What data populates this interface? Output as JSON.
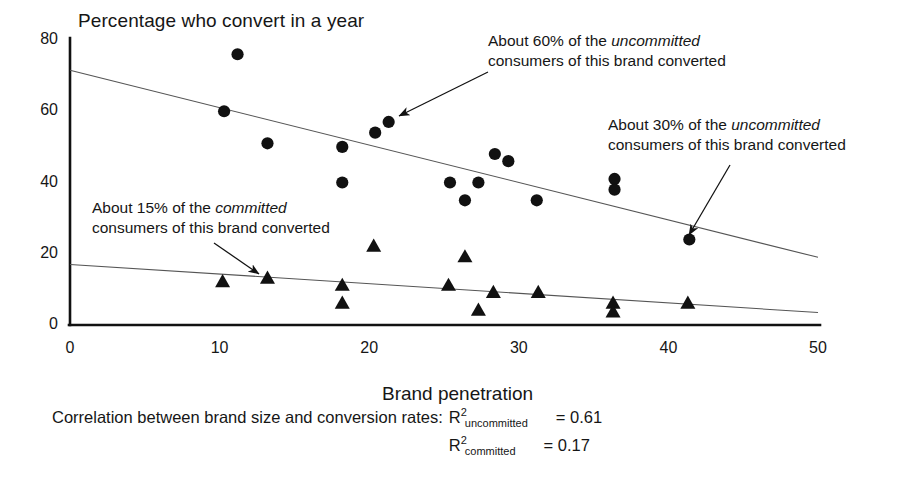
{
  "chart_data": {
    "type": "scatter",
    "title": "Percentage who convert in a year",
    "xlabel": "Brand penetration",
    "ylabel": "Percentage who convert in a year",
    "xlim": [
      0,
      50
    ],
    "ylim": [
      0,
      80
    ],
    "xticks": [
      0,
      10,
      20,
      30,
      40,
      50
    ],
    "yticks": [
      0,
      20,
      40,
      60,
      80
    ],
    "grid": false,
    "legend_position": "none",
    "series": [
      {
        "name": "uncommitted",
        "marker": "circle",
        "color": "#111111",
        "points": [
          {
            "x": 11.2,
            "y": 76
          },
          {
            "x": 10.3,
            "y": 60
          },
          {
            "x": 13.2,
            "y": 51
          },
          {
            "x": 18.2,
            "y": 50
          },
          {
            "x": 18.2,
            "y": 40
          },
          {
            "x": 20.4,
            "y": 54
          },
          {
            "x": 21.3,
            "y": 57
          },
          {
            "x": 25.4,
            "y": 40
          },
          {
            "x": 26.4,
            "y": 35
          },
          {
            "x": 27.3,
            "y": 40
          },
          {
            "x": 28.4,
            "y": 48
          },
          {
            "x": 29.3,
            "y": 46
          },
          {
            "x": 31.2,
            "y": 35
          },
          {
            "x": 36.4,
            "y": 41
          },
          {
            "x": 36.4,
            "y": 38
          },
          {
            "x": 41.4,
            "y": 24
          }
        ],
        "trendline": {
          "x0": 0,
          "y0": 71.5,
          "x1": 50,
          "y1": 19
        }
      },
      {
        "name": "committed",
        "marker": "triangle",
        "color": "#111111",
        "points": [
          {
            "x": 10.2,
            "y": 12
          },
          {
            "x": 13.2,
            "y": 13
          },
          {
            "x": 18.2,
            "y": 11
          },
          {
            "x": 18.2,
            "y": 6
          },
          {
            "x": 20.3,
            "y": 22
          },
          {
            "x": 25.3,
            "y": 11
          },
          {
            "x": 26.4,
            "y": 19
          },
          {
            "x": 27.3,
            "y": 4
          },
          {
            "x": 28.3,
            "y": 9
          },
          {
            "x": 31.3,
            "y": 9
          },
          {
            "x": 36.3,
            "y": 6
          },
          {
            "x": 36.3,
            "y": 3.5
          },
          {
            "x": 41.3,
            "y": 6
          }
        ],
        "trendline": {
          "x0": 0,
          "y0": 17,
          "x1": 50,
          "y1": 3.5
        }
      }
    ],
    "annotations": [
      {
        "id": "ann-60",
        "line1_prefix": "About 60% of the ",
        "line1_italic": "uncommitted",
        "line2": "consumers of this brand converted",
        "arrow_from": {
          "x": 488,
          "y": 72
        },
        "arrow_to": {
          "x": 399,
          "y": 116
        }
      },
      {
        "id": "ann-30",
        "line1_prefix": "About 30% of the ",
        "line1_italic": "uncommitted",
        "line2": "consumers of this brand converted",
        "arrow_from": {
          "x": 730,
          "y": 165
        },
        "arrow_to": {
          "x": 689,
          "y": 235
        }
      },
      {
        "id": "ann-15",
        "line1_prefix": "About 15% of the ",
        "line1_italic": "committed",
        "line2": "consumers of this brand converted",
        "arrow_from": {
          "x": 214,
          "y": 243
        },
        "arrow_to": {
          "x": 259,
          "y": 274
        }
      }
    ],
    "footnote": {
      "lead": "Correlation between brand size and conversion rates:",
      "rows": [
        {
          "symbol": "R",
          "superscript": "2",
          "subscript": "uncommitted",
          "value": "= 0.61"
        },
        {
          "symbol": "R",
          "superscript": "2",
          "subscript": "committed",
          "value": "= 0.17"
        }
      ]
    }
  },
  "colors": {
    "axis": "#111111",
    "marker": "#111111",
    "trendline": "#555555",
    "text": "#161616",
    "background": "#ffffff"
  }
}
